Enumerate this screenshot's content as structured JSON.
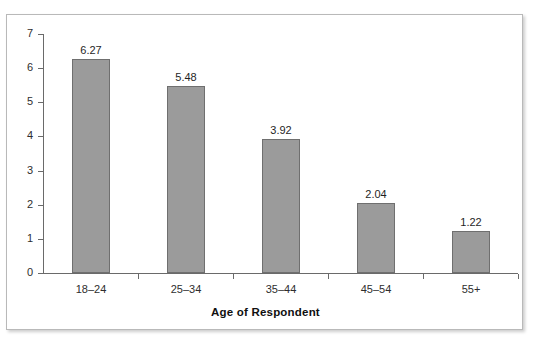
{
  "figure": {
    "cut_off_text_above": "",
    "frame_border_color": "#b9b9b9",
    "background_color": "#ffffff"
  },
  "chart_data": {
    "type": "bar",
    "title": "",
    "subtitle": "",
    "xlabel": "Age of Respondent",
    "ylabel": "",
    "categories": [
      "18–24",
      "25–34",
      "35–44",
      "45–54",
      "55+"
    ],
    "values": [
      6.27,
      5.48,
      3.92,
      2.04,
      1.22
    ],
    "value_labels": [
      "6.27",
      "5.48",
      "3.92",
      "2.04",
      "1.22"
    ],
    "ylim": [
      0,
      7
    ],
    "ytick_labels": [
      "0",
      "1",
      "2",
      "3",
      "4",
      "5",
      "6",
      "7"
    ],
    "ytick_values": [
      0,
      1,
      2,
      3,
      4,
      5,
      6,
      7
    ],
    "grid": false,
    "legend": null,
    "legend_position": "none",
    "bar_fill_color": "#9b9b9b",
    "bar_border_color": "#6f6f6f",
    "axis_color": "#6a6a6a"
  }
}
